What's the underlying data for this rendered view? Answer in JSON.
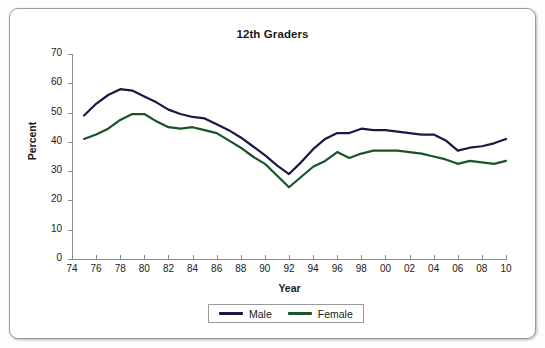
{
  "chart_data": {
    "type": "line",
    "title": "12th Graders",
    "xlabel": "Year",
    "ylabel": "Percent",
    "xlim": [
      1974,
      2010
    ],
    "ylim": [
      0,
      70
    ],
    "ytick_step": 10,
    "xtick_step": 2,
    "grid": false,
    "legend_position": "bottom-center",
    "xtick_labels": [
      "74",
      "76",
      "78",
      "80",
      "82",
      "84",
      "86",
      "88",
      "90",
      "92",
      "94",
      "96",
      "98",
      "00",
      "02",
      "04",
      "06",
      "08",
      "10"
    ],
    "xtick_values": [
      1974,
      1976,
      1978,
      1980,
      1982,
      1984,
      1986,
      1988,
      1990,
      1992,
      1994,
      1996,
      1998,
      2000,
      2002,
      2004,
      2006,
      2008,
      2010
    ],
    "ytick_labels": [
      "0",
      "10",
      "20",
      "30",
      "40",
      "50",
      "60",
      "70"
    ],
    "ytick_values": [
      0,
      10,
      20,
      30,
      40,
      50,
      60,
      70
    ],
    "x": [
      1975,
      1976,
      1977,
      1978,
      1979,
      1980,
      1981,
      1982,
      1983,
      1984,
      1985,
      1986,
      1987,
      1988,
      1989,
      1990,
      1991,
      1992,
      1993,
      1994,
      1995,
      1996,
      1997,
      1998,
      1999,
      2000,
      2001,
      2002,
      2003,
      2004,
      2005,
      2006,
      2007,
      2008,
      2009,
      2010
    ],
    "series": [
      {
        "name": "Male",
        "color": "#191948",
        "values": [
          49.0,
          53.0,
          56.0,
          58.0,
          57.5,
          55.5,
          53.5,
          51.0,
          49.5,
          48.5,
          48.0,
          46.0,
          44.0,
          41.5,
          38.5,
          35.5,
          32.0,
          29.0,
          33.0,
          37.5,
          41.0,
          43.0,
          43.0,
          44.5,
          44.0,
          44.0,
          43.5,
          43.0,
          42.5,
          42.5,
          40.5,
          37.0,
          38.0,
          38.5,
          39.5,
          41.0
        ]
      },
      {
        "name": "Female",
        "color": "#18532a",
        "values": [
          41.0,
          42.5,
          44.5,
          47.5,
          49.5,
          49.5,
          47.0,
          45.0,
          44.5,
          45.0,
          44.0,
          43.0,
          40.5,
          38.0,
          35.0,
          32.5,
          28.5,
          24.5,
          28.0,
          31.5,
          33.5,
          36.5,
          34.5,
          36.0,
          37.0,
          37.0,
          37.0,
          36.5,
          36.0,
          35.0,
          34.0,
          32.5,
          33.5,
          33.0,
          32.5,
          33.5
        ]
      }
    ]
  },
  "legend": {
    "entries": [
      {
        "label": "Male",
        "color": "#191948"
      },
      {
        "label": "Female",
        "color": "#18532a"
      }
    ]
  }
}
